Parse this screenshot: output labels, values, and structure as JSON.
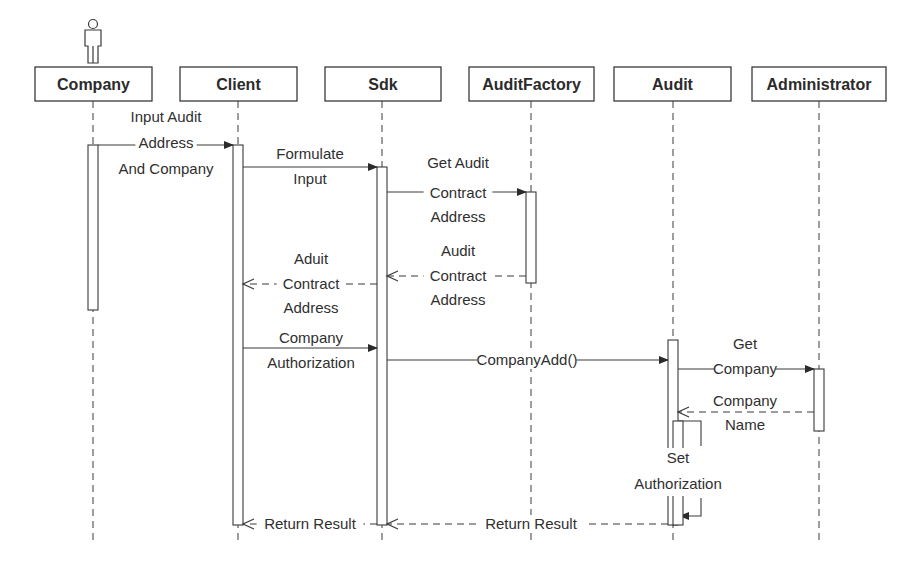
{
  "diagram": {
    "type": "sequence",
    "colors": {
      "line": "#3a3a3a",
      "text": "#2b2b2b",
      "background": "#ffffff"
    },
    "participants": [
      {
        "id": "company",
        "label": "Company",
        "kind": "actor",
        "box": [
          35,
          67,
          117,
          34
        ],
        "x": 93
      },
      {
        "id": "client",
        "label": "Client",
        "kind": "object",
        "box": [
          180,
          67,
          117,
          34
        ],
        "x": 238
      },
      {
        "id": "sdk",
        "label": "Sdk",
        "kind": "object",
        "box": [
          325,
          67,
          116,
          34
        ],
        "x": 382
      },
      {
        "id": "auditfactory",
        "label": "AuditFactory",
        "kind": "object",
        "box": [
          469,
          67,
          125,
          34
        ],
        "x": 531
      },
      {
        "id": "audit",
        "label": "Audit",
        "kind": "object",
        "box": [
          614,
          67,
          117,
          34
        ],
        "x": 673
      },
      {
        "id": "administrator",
        "label": "Administrator",
        "kind": "object",
        "box": [
          752,
          67,
          134,
          34
        ],
        "x": 819
      }
    ],
    "lifeline_end": 540,
    "activations": [
      {
        "on": "company",
        "x": 88,
        "y1": 145,
        "y2": 310
      },
      {
        "on": "client",
        "x": 233,
        "y1": 145,
        "y2": 525
      },
      {
        "on": "sdk",
        "x": 377,
        "y1": 167,
        "y2": 525
      },
      {
        "on": "auditfactory",
        "x": 526,
        "y1": 192,
        "y2": 283
      },
      {
        "on": "audit",
        "x": 668,
        "y1": 340,
        "y2": 525
      },
      {
        "on": "administrator",
        "x": 814,
        "y1": 369,
        "y2": 431
      }
    ],
    "messages": [
      {
        "id": "m1",
        "from": "company",
        "to": "client",
        "kind": "sync",
        "x1": 98,
        "x2": 233,
        "y": 145,
        "label_lines": [
          "Input Audit",
          "Address",
          "And Company"
        ],
        "label_x": 166,
        "label_y": [
          122,
          148,
          174
        ]
      },
      {
        "id": "m2",
        "from": "client",
        "to": "sdk",
        "kind": "sync",
        "x1": 243,
        "x2": 377,
        "y": 167,
        "label_lines": [
          "Formulate",
          "Input"
        ],
        "label_x": 310,
        "label_y": [
          159,
          184
        ]
      },
      {
        "id": "m3",
        "from": "sdk",
        "to": "auditfactory",
        "kind": "sync",
        "x1": 387,
        "x2": 526,
        "y": 192,
        "label_lines": [
          "Get Audit",
          "Contract",
          "Address"
        ],
        "label_x": 458,
        "label_y": [
          168,
          198,
          222
        ]
      },
      {
        "id": "m4",
        "from": "auditfactory",
        "to": "sdk",
        "kind": "reply",
        "x1": 526,
        "x2": 387,
        "y": 276,
        "label_lines": [
          "Audit",
          "Contract",
          "Address"
        ],
        "label_x": 458,
        "label_y": [
          256,
          281,
          305
        ]
      },
      {
        "id": "m5",
        "from": "sdk",
        "to": "client",
        "kind": "reply",
        "x1": 377,
        "x2": 243,
        "y": 284,
        "label_lines": [
          "Aduit",
          "Contract",
          "Address"
        ],
        "label_x": 311,
        "label_y": [
          264,
          289,
          313
        ]
      },
      {
        "id": "m6",
        "from": "client",
        "to": "sdk",
        "kind": "sync",
        "x1": 243,
        "x2": 377,
        "y": 348,
        "label_lines": [
          "Company",
          "Authorization"
        ],
        "label_x": 311,
        "label_y": [
          343,
          368
        ]
      },
      {
        "id": "m7",
        "from": "sdk",
        "to": "audit",
        "kind": "sync",
        "x1": 387,
        "x2": 668,
        "y": 360,
        "label_lines": [
          "CompanyAdd()"
        ],
        "label_x": 527,
        "label_y": [
          365
        ]
      },
      {
        "id": "m8",
        "from": "audit",
        "to": "administrator",
        "kind": "sync",
        "x1": 678,
        "x2": 814,
        "y": 369,
        "label_lines": [
          "Get",
          "Company"
        ],
        "label_x": 745,
        "label_y": [
          349,
          374
        ]
      },
      {
        "id": "m9",
        "from": "administrator",
        "to": "audit",
        "kind": "reply",
        "x1": 814,
        "x2": 678,
        "y": 412,
        "label_lines": [
          "Company",
          "Name"
        ],
        "label_x": 745,
        "label_y": [
          406,
          430
        ]
      },
      {
        "id": "m10",
        "from": "audit",
        "to": "audit",
        "kind": "self",
        "label_lines": [
          "Set",
          "Authorization"
        ],
        "label_x": 678,
        "label_y": [
          463,
          489
        ]
      },
      {
        "id": "m11",
        "from": "audit",
        "to": "sdk",
        "kind": "reply",
        "x1": 668,
        "x2": 387,
        "y": 524,
        "label_lines": [
          "Return Result"
        ],
        "label_x": 531,
        "label_y": [
          529
        ]
      },
      {
        "id": "m12",
        "from": "sdk",
        "to": "client",
        "kind": "reply",
        "x1": 377,
        "x2": 243,
        "y": 524,
        "label_lines": [
          "Return Result"
        ],
        "label_x": 310,
        "label_y": [
          529
        ]
      }
    ]
  }
}
